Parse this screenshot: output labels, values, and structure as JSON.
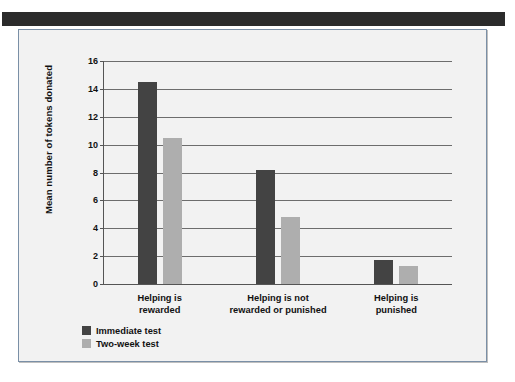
{
  "figure": {
    "background_color": "#f2f2f2",
    "frame_color": "#7a8fa6",
    "header_band_color": "#2b2b2b"
  },
  "chart_data": {
    "type": "bar",
    "title": "",
    "xlabel": "",
    "ylabel": "Mean number of tokens donated",
    "ylim": [
      0,
      16
    ],
    "ytick_step": 2,
    "yticks": [
      "16",
      "14",
      "12",
      "10",
      "8",
      "6",
      "4",
      "2",
      "0"
    ],
    "grid": "horizontal",
    "legend_position": "bottom-left",
    "categories": [
      "Helping is\nrewarded",
      "Helping is not\nrewarded or punished",
      "Helping is\npunished"
    ],
    "category_lines": [
      [
        "Helping is",
        "rewarded"
      ],
      [
        "Helping is not",
        "rewarded or punished"
      ],
      [
        "Helping is",
        "punished"
      ]
    ],
    "series": [
      {
        "name": "Immediate test",
        "color": "#434343",
        "values": [
          14.5,
          8.2,
          1.7
        ]
      },
      {
        "name": "Two-week test",
        "color": "#aeaeae",
        "values": [
          10.5,
          4.8,
          1.3
        ]
      }
    ]
  }
}
